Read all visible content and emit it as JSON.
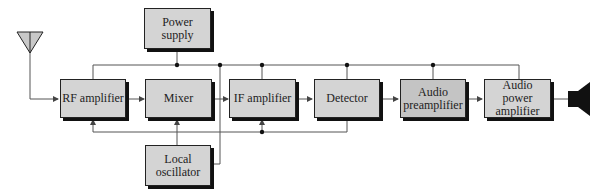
{
  "diagram": {
    "blocks": {
      "power_supply": "Power supply",
      "rf_amplifier": "RF amplifier",
      "mixer": "Mixer",
      "if_amplifier": "IF amplifier",
      "detector": "Detector",
      "audio_preamplifier_l1": "Audio",
      "audio_preamplifier_l2": "preamplifier",
      "audio_power_amplifier_l1": "Audio",
      "audio_power_amplifier_l2": "power",
      "audio_power_amplifier_l3": "amplifier",
      "local_oscillator_l1": "Local",
      "local_oscillator_l2": "oscillator"
    },
    "colors": {
      "box_fill": "#d4d4d4",
      "box_fill_dark": "#c4c4c4",
      "line": "#555555",
      "shadow": "#111111"
    }
  }
}
